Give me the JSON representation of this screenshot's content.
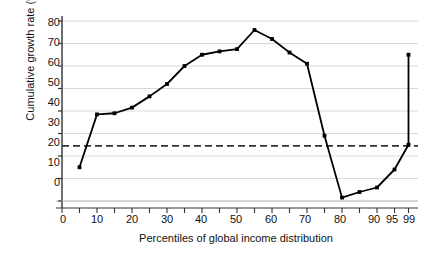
{
  "chart_data": {
    "type": "line",
    "title": "",
    "xlabel": "Percentiles of global income distribution",
    "ylabel": "Cumulative growth rate (%)",
    "xlim": [
      0,
      100
    ],
    "ylim": [
      0,
      80
    ],
    "grid": true,
    "legend": "none",
    "y_ticks": [
      0,
      10,
      20,
      30,
      40,
      50,
      60,
      70,
      80
    ],
    "y_tick_labels": [
      "0",
      "10",
      "20",
      "30",
      "40",
      "50",
      "60",
      "70",
      "80"
    ],
    "x_ticks": [
      0,
      5,
      10,
      15,
      20,
      25,
      30,
      35,
      40,
      45,
      50,
      55,
      60,
      65,
      70,
      75,
      80,
      85,
      90,
      95,
      99
    ],
    "x_tick_labels": [
      {
        "value": 0,
        "label": "0"
      },
      {
        "value": 10,
        "label": "10"
      },
      {
        "value": 20,
        "label": "20"
      },
      {
        "value": 30,
        "label": "30"
      },
      {
        "value": 40,
        "label": "40"
      },
      {
        "value": 50,
        "label": "50"
      },
      {
        "value": 60,
        "label": "60"
      },
      {
        "value": 70,
        "label": "70"
      },
      {
        "value": 80,
        "label": "80"
      },
      {
        "value": 90,
        "label": "90"
      },
      {
        "value": 95,
        "label": "95"
      },
      {
        "value": 99,
        "label": "99"
      }
    ],
    "series": [
      {
        "name": "Cumulative growth rate",
        "color": "#000000",
        "marker": "filled-square",
        "x": [
          5,
          10,
          15,
          20,
          25,
          30,
          35,
          40,
          45,
          50,
          55,
          60,
          65,
          70,
          75,
          80,
          85,
          90,
          95,
          99,
          99
        ],
        "values": [
          15,
          38.5,
          39,
          41.5,
          46.5,
          52,
          60,
          65,
          66.5,
          67.5,
          76,
          72,
          66,
          61,
          29,
          1.5,
          4,
          6,
          14,
          25,
          65
        ]
      }
    ],
    "reference_line": {
      "name": "mean-growth-reference",
      "value": 24.5,
      "style": "dashed",
      "color": "#333333"
    }
  }
}
